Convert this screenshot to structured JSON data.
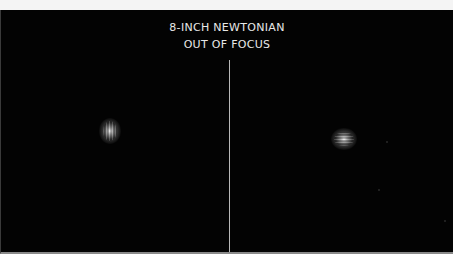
{
  "title": {
    "line1": "8-INCH NEWTONIAN",
    "line2": "OUT OF FOCUS"
  },
  "panels": [
    {
      "name": "left",
      "description": "defocused star image, vertically elongated with vertical fringes"
    },
    {
      "name": "right",
      "description": "defocused star image, horizontally elongated with horizontal fringes"
    }
  ],
  "colors": {
    "background": "#030303",
    "text": "#e8e8e8",
    "divider": "#b8b8b8"
  }
}
